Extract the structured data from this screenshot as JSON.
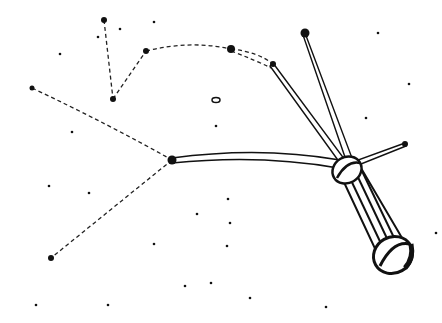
{
  "illustration": {
    "subject": "constellation drawing with a stylized comet/probe",
    "colors": {
      "background": "#ffffff",
      "ink": "#111111"
    },
    "stars": [
      {
        "x": 104,
        "y": 20,
        "r": 3
      },
      {
        "x": 146,
        "y": 51,
        "r": 3
      },
      {
        "x": 113,
        "y": 99,
        "r": 3
      },
      {
        "x": 32,
        "y": 88,
        "r": 2.5
      },
      {
        "x": 231,
        "y": 49,
        "r": 4
      },
      {
        "x": 273,
        "y": 64,
        "r": 3
      },
      {
        "x": 305,
        "y": 33,
        "r": 4.5
      },
      {
        "x": 172,
        "y": 160,
        "r": 4.5
      },
      {
        "x": 51,
        "y": 258,
        "r": 3
      },
      {
        "x": 405,
        "y": 144,
        "r": 3
      }
    ],
    "dust": [
      [
        154,
        22
      ],
      [
        120,
        29
      ],
      [
        98,
        37
      ],
      [
        60,
        54
      ],
      [
        378,
        33
      ],
      [
        409,
        84
      ],
      [
        366,
        118
      ],
      [
        216,
        126
      ],
      [
        72,
        132
      ],
      [
        49,
        186
      ],
      [
        89,
        193
      ],
      [
        197,
        214
      ],
      [
        154,
        244
      ],
      [
        230,
        223
      ],
      [
        185,
        286
      ],
      [
        211,
        283
      ],
      [
        36,
        305
      ],
      [
        108,
        305
      ],
      [
        250,
        298
      ],
      [
        326,
        307
      ],
      [
        228,
        199
      ],
      [
        227,
        246
      ],
      [
        436,
        233
      ]
    ],
    "dashed_lines": [
      "M104,20 L113,99",
      "M113,99 L146,51",
      "M146,51 Q190,40 231,49",
      "M231,49 Q258,52 273,64",
      "M231,51 Q255,60 271,68",
      "M32,88 Q110,125 172,160",
      "M172,160 L51,258"
    ],
    "ring": {
      "cx": 216,
      "cy": 100,
      "rx": 4,
      "ry": 2.5
    }
  }
}
